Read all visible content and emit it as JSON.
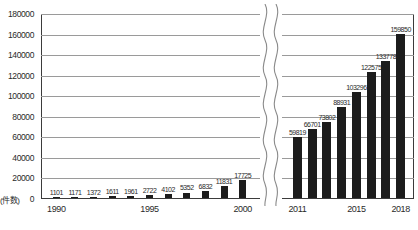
{
  "chart_data": {
    "type": "bar",
    "title": "",
    "subtitle": "",
    "xlabel": "",
    "ylabel": "(件数)",
    "ylim": [
      0,
      180000
    ],
    "ytick_step": 20000,
    "yticks": [
      "180000",
      "160000",
      "140000",
      "120000",
      "100000",
      "80000",
      "60000",
      "40000",
      "20000",
      "0"
    ],
    "grid": true,
    "legend": null,
    "axis_break": true,
    "axis_break_note": "wavy break between 2000 and 2011",
    "categories": [
      "1990",
      "1991",
      "1992",
      "1993",
      "1994",
      "1995",
      "1996",
      "1997",
      "1998",
      "1999",
      "2000",
      "2011",
      "2012",
      "2013",
      "2014",
      "2015",
      "2016",
      "2017",
      "2018"
    ],
    "values": [
      1101,
      1171,
      1372,
      1611,
      1961,
      2722,
      4102,
      5352,
      6832,
      11831,
      17725,
      59819,
      66701,
      73802,
      88931,
      103296,
      122575,
      133778,
      159850
    ],
    "segments": [
      {
        "name": "left-segment",
        "categories": [
          "1990",
          "1991",
          "1992",
          "1993",
          "1994",
          "1995",
          "1996",
          "1997",
          "1998",
          "1999",
          "2000"
        ],
        "values": [
          1101,
          1171,
          1372,
          1611,
          1961,
          2722,
          4102,
          5352,
          6832,
          11831,
          17725
        ],
        "labels": [
          "1101",
          "1171",
          "1372",
          "1611",
          "1961",
          "2722",
          "4102",
          "5352",
          "6832",
          "11831",
          "17725"
        ],
        "xticks": [
          "1990",
          "1995",
          "2000"
        ],
        "xtick_indices": [
          0,
          5,
          10
        ]
      },
      {
        "name": "right-segment",
        "categories": [
          "2011",
          "2012",
          "2013",
          "2014",
          "2015",
          "2016",
          "2017",
          "2018"
        ],
        "values": [
          59819,
          66701,
          73802,
          88931,
          103296,
          122575,
          133778,
          159850
        ],
        "labels": [
          "59819",
          "66701",
          "73802",
          "88931",
          "103296",
          "122575",
          "133778",
          "159850"
        ],
        "xticks": [
          "2011",
          "2015",
          "2018"
        ],
        "xtick_indices": [
          0,
          4,
          7
        ]
      }
    ],
    "colors": {
      "bar": "#1c1c1c",
      "grid": "#9a9a9a",
      "axis": "#3b3b3b",
      "text": "#2a2a2a",
      "background": "#ffffff"
    }
  }
}
